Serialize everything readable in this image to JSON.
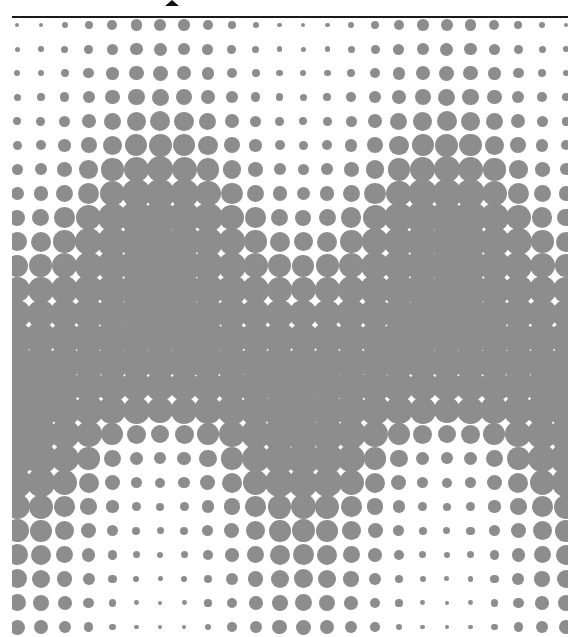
{
  "figure": {
    "background": "#ffffff",
    "dot_color": "#8d8d8d",
    "rule_color": "#1a1a1a",
    "top_rule": {
      "x": 12,
      "y": 16,
      "width": 556
    },
    "glyph_fragment": {
      "x": 165,
      "y": 0
    },
    "clip": {
      "left": 12,
      "top": 18,
      "right": 568,
      "bottom": 637
    },
    "grid": {
      "cols": 24,
      "rows": 26,
      "x0": 17,
      "dx": 23.87,
      "y0": 25,
      "dy": 24.08
    },
    "peak_profile_by_row": [
      12,
      13,
      15,
      17,
      20,
      23,
      26,
      30,
      34,
      34,
      34,
      34,
      34,
      34,
      33,
      30,
      26,
      18,
      12,
      10,
      8,
      7,
      6,
      5,
      4,
      4
    ],
    "trough_profile_by_row": [
      4,
      5,
      6,
      7,
      8,
      9,
      11,
      13,
      16,
      19,
      22,
      25,
      28,
      31,
      33,
      34,
      34,
      34,
      33,
      30,
      25,
      23,
      21,
      19,
      17,
      15
    ],
    "column_peak_weight": [
      0,
      0.067,
      0.25,
      0.5,
      0.75,
      0.933,
      1,
      0.933,
      0.75,
      0.5,
      0.25,
      0.067,
      0,
      0.067,
      0.25,
      0.5,
      0.75,
      0.933,
      1,
      0.933,
      0.75,
      0.5,
      0.25,
      0.067
    ]
  }
}
